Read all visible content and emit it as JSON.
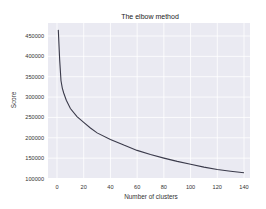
{
  "chart_data": {
    "type": "line",
    "title": "The elbow method",
    "xlabel": "Number of clusters",
    "ylabel": "Score",
    "xlim": [
      -4,
      144
    ],
    "ylim": [
      100000,
      470000
    ],
    "x_ticks": [
      0,
      20,
      40,
      60,
      80,
      100,
      120,
      140
    ],
    "y_ticks": [
      100000,
      150000,
      200000,
      250000,
      300000,
      350000,
      400000,
      450000
    ],
    "grid": true,
    "background": "#eaeaf2",
    "line_color": "#3a3a4a",
    "series": [
      {
        "name": "Score",
        "x": [
          1,
          2,
          3,
          4,
          5,
          7,
          10,
          15,
          20,
          25,
          30,
          40,
          50,
          60,
          70,
          80,
          90,
          100,
          110,
          120,
          130,
          140
        ],
        "values": [
          465000,
          390000,
          340000,
          322000,
          310000,
          292000,
          272000,
          252000,
          238000,
          224000,
          212000,
          196000,
          182000,
          169000,
          159000,
          150000,
          142000,
          135000,
          128000,
          122000,
          118000,
          114000
        ]
      }
    ]
  }
}
